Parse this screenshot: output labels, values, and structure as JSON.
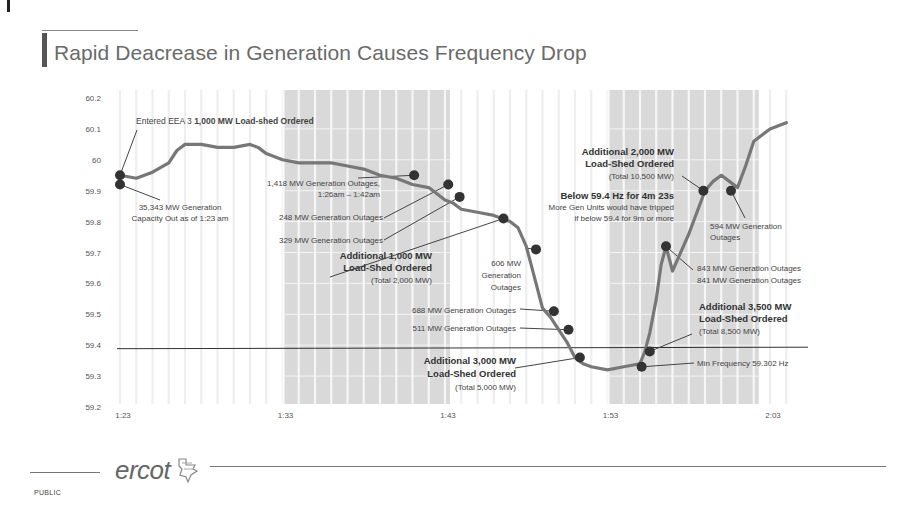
{
  "slide": {
    "title": "Rapid Deacrease in Generation Causes Frequency Drop",
    "footer": {
      "logo_text": "ercot",
      "logo_icon": "texas-flag-icon",
      "classification": "PUBLIC"
    }
  },
  "chart_data": {
    "type": "line",
    "title": "Rapid Deacrease in Generation Causes Frequency Drop",
    "xlabel": "",
    "ylabel": "Frequency (Hz)",
    "x_ticks": [
      "1:23",
      "1:33",
      "1:43",
      "1:53",
      "2:03"
    ],
    "y_ticks": [
      "60.2",
      "60.1",
      "60",
      "59.9",
      "59.8",
      "59.7",
      "59.6",
      "59.5",
      "59.4",
      "59.3",
      "59.2"
    ],
    "ylim": [
      59.2,
      60.2
    ],
    "xlim_minutes_after_1_00": [
      23,
      64
    ],
    "grid": "vertical lines every minute; horizontal lines in shaded regions",
    "reference_line": {
      "value": 59.4,
      "label": "59.4 Hz"
    },
    "shaded_regions": [
      {
        "start": "1:33",
        "end": "1:43"
      },
      {
        "start": "1:53",
        "end": "2:02"
      }
    ],
    "series": [
      {
        "name": "System Frequency",
        "x_minutes": [
          23.0,
          24.0,
          25.0,
          26.0,
          26.5,
          27.0,
          28.0,
          29.0,
          30.0,
          31.0,
          31.5,
          32.0,
          33.0,
          34.0,
          35.0,
          36.0,
          37.0,
          38.0,
          39.0,
          40.0,
          41.0,
          42.0,
          42.5,
          43.0,
          43.5,
          44.0,
          45.0,
          46.0,
          47.0,
          47.5,
          48.0,
          48.5,
          49.0,
          49.5,
          50.0,
          50.5,
          51.0,
          51.5,
          52.0,
          53.0,
          54.0,
          55.0,
          55.3,
          55.6,
          56.0,
          56.3,
          56.6,
          57.0,
          58.0,
          59.0,
          59.5,
          60.0,
          60.5,
          61.0,
          61.5,
          62.0,
          63.0,
          64.0
        ],
        "values": [
          59.95,
          59.94,
          59.96,
          59.99,
          60.03,
          60.05,
          60.05,
          60.04,
          60.04,
          60.05,
          60.04,
          60.02,
          60.0,
          59.99,
          59.99,
          59.99,
          59.98,
          59.97,
          59.95,
          59.94,
          59.92,
          59.91,
          59.89,
          59.87,
          59.86,
          59.84,
          59.83,
          59.82,
          59.8,
          59.78,
          59.72,
          59.62,
          59.52,
          59.49,
          59.45,
          59.41,
          59.36,
          59.34,
          59.33,
          59.32,
          59.33,
          59.34,
          59.38,
          59.44,
          59.55,
          59.66,
          59.72,
          59.64,
          59.76,
          59.9,
          59.93,
          59.95,
          59.93,
          59.91,
          59.98,
          60.06,
          60.1,
          60.12
        ]
      }
    ],
    "markers": [
      {
        "x_minutes": 23.0,
        "value": 59.95
      },
      {
        "x_minutes": 23.0,
        "value": 59.92
      },
      {
        "x_minutes": 41.1,
        "value": 59.95
      },
      {
        "x_minutes": 43.2,
        "value": 59.92
      },
      {
        "x_minutes": 43.9,
        "value": 59.88
      },
      {
        "x_minutes": 46.6,
        "value": 59.81
      },
      {
        "x_minutes": 48.6,
        "value": 59.71
      },
      {
        "x_minutes": 49.7,
        "value": 59.51
      },
      {
        "x_minutes": 50.6,
        "value": 59.45
      },
      {
        "x_minutes": 51.3,
        "value": 59.36
      },
      {
        "x_minutes": 55.1,
        "value": 59.33
      },
      {
        "x_minutes": 55.6,
        "value": 59.38
      },
      {
        "x_minutes": 56.6,
        "value": 59.72
      },
      {
        "x_minutes": 58.9,
        "value": 59.9
      },
      {
        "x_minutes": 60.6,
        "value": 59.9
      }
    ],
    "annotations": [
      {
        "id": "eea3",
        "text_normal": "Entered EEA 3 ",
        "text_bold": "1,000 MW Load-shed Ordered"
      },
      {
        "id": "capacity-out",
        "lines": [
          "35,343 MW Generation",
          "Capacity Out as of 1:23 am"
        ]
      },
      {
        "id": "outage-1418",
        "lines": [
          "1,418 MW Generation Outages,",
          "1:26am – 1:42am"
        ]
      },
      {
        "id": "outage-248",
        "lines": [
          "248 MW Generation Outages"
        ]
      },
      {
        "id": "outage-329",
        "lines": [
          "329 MW Generation Outages"
        ]
      },
      {
        "id": "loadshed-1000",
        "bold_lines": [
          "Additional 1,000 MW",
          "Load-Shed Ordered"
        ],
        "lines": [
          "(Total 2,000 MW)"
        ]
      },
      {
        "id": "outage-606",
        "lines": [
          "606 MW",
          "Generation",
          "Outages"
        ]
      },
      {
        "id": "outage-688",
        "lines": [
          "688 MW Generation Outages"
        ]
      },
      {
        "id": "outage-511",
        "lines": [
          "511 MW Generation Outages"
        ]
      },
      {
        "id": "loadshed-3000",
        "bold_lines": [
          "Additional 3,000 MW",
          "Load-Shed Ordered"
        ],
        "lines": [
          "(Total 5,000 MW)"
        ]
      },
      {
        "id": "loadshed-2000",
        "bold_lines": [
          "Additional 2,000 MW",
          "Load-Shed Ordered"
        ],
        "lines": [
          "(Total 10,500 MW)"
        ]
      },
      {
        "id": "below-59-4",
        "bold_lines": [
          "Below 59.4 Hz for 4m 23s"
        ],
        "lines": [
          "More Gen Units would have tripped",
          "if below 59.4 for 9m or more"
        ]
      },
      {
        "id": "outage-594",
        "lines": [
          "594 MW Generation",
          "Outages"
        ]
      },
      {
        "id": "outage-843-841",
        "lines": [
          "843 MW Generation Outages",
          "841 MW Generation Outages"
        ]
      },
      {
        "id": "loadshed-3500",
        "bold_lines": [
          "Additional 3,500 MW",
          "Load-Shed Ordered"
        ],
        "lines": [
          "(Total 8,500 MW)"
        ]
      },
      {
        "id": "min-frequency",
        "lines": [
          "Min Frequency 59.302 Hz"
        ]
      }
    ],
    "colors": {
      "line": "#777777",
      "marker": "#333333",
      "shade": "#d9d9d9",
      "grid": "#eeeeee",
      "reference": "#333333"
    }
  }
}
